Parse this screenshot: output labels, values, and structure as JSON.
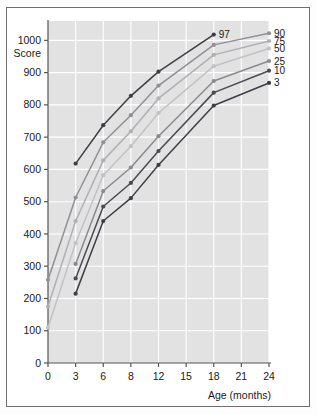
{
  "figure": {
    "background_color": "#fdfdfd",
    "frame_color": "#6f6f6f",
    "plot_background_color": "#e2e2e2",
    "gridline_color": "#ffffff",
    "axis_color": "#555555"
  },
  "chart_data": {
    "type": "line",
    "title": "",
    "subtitle": "",
    "xlabel": "Age (months)",
    "ylabel": "Score",
    "x": [
      0,
      3,
      6,
      8,
      12,
      15,
      18,
      21,
      24
    ],
    "xtick_labels": [
      "0",
      "3",
      "6",
      "8",
      "12",
      "15",
      "18",
      "21",
      "24"
    ],
    "ytick_labels": [
      "0",
      "100",
      "200",
      "300",
      "400",
      "500",
      "600",
      "700",
      "800",
      "900",
      "1000"
    ],
    "ylim": [
      0,
      1060
    ],
    "ytick_values": [
      0,
      100,
      200,
      300,
      400,
      500,
      600,
      700,
      800,
      900,
      1000
    ],
    "grid": true,
    "legend_position": "right-end-labels",
    "annotations": [
      {
        "text": "97",
        "x": 18,
        "y": 1018,
        "series": "97"
      }
    ],
    "series": [
      {
        "name": "97",
        "label": "97",
        "color": "#3e3e44",
        "marker": "circle",
        "x": [
          3,
          6,
          8,
          12,
          18
        ],
        "values": [
          618,
          737,
          828,
          903,
          1018
        ]
      },
      {
        "name": "90",
        "label": "90",
        "color": "#909096",
        "marker": "circle",
        "x": [
          0,
          3,
          6,
          8,
          12,
          18,
          24
        ],
        "values": [
          258,
          513,
          684,
          768,
          860,
          986,
          1022
        ]
      },
      {
        "name": "75",
        "label": "75",
        "color": "#b0b0b4",
        "marker": "circle",
        "x": [
          0,
          3,
          6,
          8,
          12,
          18,
          24
        ],
        "values": [
          175,
          440,
          628,
          718,
          820,
          955,
          998
        ]
      },
      {
        "name": "50",
        "label": "50",
        "color": "#c2c2c6",
        "marker": "circle",
        "x": [
          0,
          3,
          6,
          8,
          12,
          18,
          24
        ],
        "values": [
          110,
          372,
          582,
          672,
          775,
          920,
          975
        ]
      },
      {
        "name": "25",
        "label": "25",
        "color": "#8a8a90",
        "marker": "circle",
        "x": [
          3,
          6,
          8,
          12,
          18,
          24
        ],
        "values": [
          307,
          533,
          606,
          703,
          874,
          936
        ]
      },
      {
        "name": "10",
        "label": "10",
        "color": "#4a4a52",
        "marker": "circle",
        "x": [
          3,
          6,
          8,
          12,
          18,
          24
        ],
        "values": [
          262,
          485,
          558,
          657,
          838,
          906
        ]
      },
      {
        "name": "3",
        "label": "3",
        "color": "#3e3e46",
        "marker": "circle",
        "x": [
          3,
          6,
          8,
          12,
          18,
          24
        ],
        "values": [
          215,
          440,
          511,
          614,
          798,
          868
        ]
      }
    ]
  }
}
